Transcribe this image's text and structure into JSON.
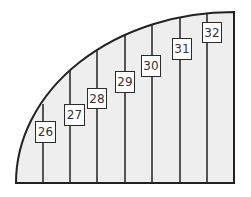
{
  "diagram": {
    "type": "quarter-ellipse divided into vertical strips with numbered labels",
    "colors": {
      "fill": "#eeeeee",
      "stroke": "#222222",
      "label_bg": "#ffffff"
    },
    "labels": [
      {
        "text": "26",
        "x": 35,
        "y": 121,
        "w": 21,
        "h": 22
      },
      {
        "text": "27",
        "x": 64,
        "y": 104,
        "w": 21,
        "h": 22
      },
      {
        "text": "28",
        "x": 87,
        "y": 88,
        "w": 20,
        "h": 21
      },
      {
        "text": "29",
        "x": 115,
        "y": 71,
        "w": 20,
        "h": 22
      },
      {
        "text": "30",
        "x": 141,
        "y": 55,
        "w": 20,
        "h": 22
      },
      {
        "text": "31",
        "x": 172,
        "y": 38,
        "w": 20,
        "h": 22
      },
      {
        "text": "32",
        "x": 202,
        "y": 22,
        "w": 20,
        "h": 21
      }
    ]
  }
}
